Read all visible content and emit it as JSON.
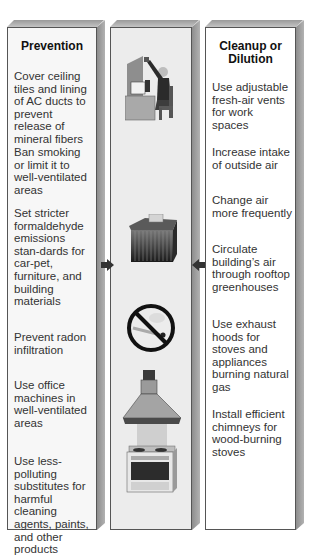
{
  "columns": {
    "left": {
      "heading": "Prevention",
      "items": [
        "Cover ceiling tiles and lining of AC ducts to prevent release of mineral fibers",
        "Ban smoking or limit it to well-ventilated areas",
        "Set stricter formaldehyde emissions stan-dards for car-pet, furniture, and building materials",
        "Prevent radon infiltration",
        "Use office machines in well-ventilated areas",
        "Use less-polluting substitutes for harmful cleaning agents, paints, and other products"
      ]
    },
    "middle": {
      "illustrations": [
        "office-worker-at-desk",
        "carpet-furniture-block",
        "no-smoking-sign",
        "stove-with-exhaust-hood"
      ]
    },
    "right": {
      "heading_line1": "Cleanup or",
      "heading_line2": "Dilution",
      "items": [
        "Use adjustable fresh-air vents for work spaces",
        "Increase intake of outside air",
        "Change air more frequently",
        "Circulate building’s air through rooftop greenhouses",
        "Use exhaust hoods for stoves and appliances burning natural gas",
        "Install efficient chimneys for wood-burning stoves"
      ]
    }
  },
  "arrows": [
    {
      "direction": "right",
      "from": "left",
      "to": "middle"
    },
    {
      "direction": "left",
      "from": "right",
      "to": "middle"
    }
  ],
  "colors": {
    "frame_border": "#555555",
    "bevel_dark": "#8d8d8d",
    "bevel_light": "#c4c4c4",
    "arrow": "#333333",
    "text": "#333333"
  }
}
